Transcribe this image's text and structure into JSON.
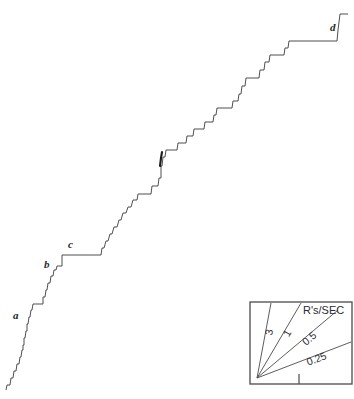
{
  "figure": {
    "width": 354,
    "height": 399,
    "background": "#ffffff",
    "ink_color": "#3b3b42"
  },
  "chart_data": {
    "type": "line",
    "title": "",
    "xlabel": "",
    "ylabel": "",
    "grid": false,
    "legend_position": "bottom-right",
    "xlim": [
      0,
      354
    ],
    "ylim": [
      399,
      0
    ],
    "series": [
      {
        "name": "cumulative-record",
        "points": [
          [
            6,
            390
          ],
          [
            7,
            385
          ],
          [
            10,
            385
          ],
          [
            11,
            378
          ],
          [
            13,
            378
          ],
          [
            14,
            371
          ],
          [
            16,
            371
          ],
          [
            17,
            364
          ],
          [
            19,
            364
          ],
          [
            20,
            357
          ],
          [
            21,
            357
          ],
          [
            22,
            350
          ],
          [
            23,
            350
          ],
          [
            23,
            345
          ],
          [
            24,
            345
          ],
          [
            24,
            338
          ],
          [
            25,
            338
          ],
          [
            26,
            331
          ],
          [
            27,
            331
          ],
          [
            27,
            324
          ],
          [
            28,
            324
          ],
          [
            29,
            317
          ],
          [
            30,
            317
          ],
          [
            31,
            310
          ],
          [
            32,
            310
          ],
          [
            33,
            304
          ],
          [
            43,
            304
          ],
          [
            43,
            297
          ],
          [
            45,
            297
          ],
          [
            46,
            290
          ],
          [
            47,
            290
          ],
          [
            48,
            283
          ],
          [
            50,
            283
          ],
          [
            51,
            276
          ],
          [
            53,
            276
          ],
          [
            54,
            270
          ],
          [
            56,
            270
          ],
          [
            57,
            266
          ],
          [
            62,
            266
          ],
          [
            62,
            255
          ],
          [
            101,
            255
          ],
          [
            102,
            248
          ],
          [
            104,
            248
          ],
          [
            106,
            241
          ],
          [
            108,
            241
          ],
          [
            110,
            234
          ],
          [
            112,
            234
          ],
          [
            114,
            227
          ],
          [
            117,
            227
          ],
          [
            119,
            220
          ],
          [
            121,
            220
          ],
          [
            123,
            213
          ],
          [
            126,
            213
          ],
          [
            128,
            207
          ],
          [
            131,
            207
          ],
          [
            133,
            200
          ],
          [
            137,
            200
          ],
          [
            138,
            194
          ],
          [
            151,
            194
          ],
          [
            152,
            186
          ],
          [
            158,
            186
          ],
          [
            159,
            178
          ],
          [
            161,
            178
          ],
          [
            161,
            166
          ],
          [
            162,
            166
          ],
          [
            163,
            157
          ],
          [
            165,
            157
          ],
          [
            166,
            150
          ],
          [
            177,
            150
          ],
          [
            178,
            143
          ],
          [
            186,
            143
          ],
          [
            187,
            136
          ],
          [
            193,
            136
          ],
          [
            194,
            129
          ],
          [
            204,
            129
          ],
          [
            205,
            122
          ],
          [
            213,
            122
          ],
          [
            214,
            115
          ],
          [
            216,
            115
          ],
          [
            217,
            108
          ],
          [
            232,
            108
          ],
          [
            233,
            101
          ],
          [
            238,
            101
          ],
          [
            239,
            94
          ],
          [
            241,
            94
          ],
          [
            242,
            86
          ],
          [
            245,
            86
          ],
          [
            246,
            78
          ],
          [
            259,
            78
          ],
          [
            260,
            70
          ],
          [
            264,
            70
          ],
          [
            265,
            62
          ],
          [
            269,
            62
          ],
          [
            270,
            55
          ],
          [
            284,
            55
          ],
          [
            285,
            48
          ],
          [
            288,
            48
          ],
          [
            289,
            41
          ],
          [
            337,
            41
          ],
          [
            338,
            30
          ],
          [
            339,
            22
          ],
          [
            340,
            14
          ],
          [
            348,
            14
          ]
        ],
        "blip": {
          "name": "pen-reset-mark",
          "points": [
            [
              160,
              166
            ],
            [
              161,
              158
            ],
            [
              162,
              152
            ]
          ]
        }
      }
    ],
    "annotations": [
      {
        "name": "point-a",
        "label": "a",
        "x": 13,
        "y": 319
      },
      {
        "name": "point-b",
        "label": "b",
        "x": 44,
        "y": 268
      },
      {
        "name": "point-c",
        "label": "c",
        "x": 68,
        "y": 248
      },
      {
        "name": "point-d",
        "label": "d",
        "x": 330,
        "y": 31
      }
    ],
    "legend": {
      "name": "rate-key",
      "title": "R's/SEC",
      "box": {
        "x": 250,
        "y": 302,
        "width": 102,
        "height": 82
      },
      "origin": {
        "x": 257,
        "y": 378
      },
      "rays": [
        {
          "label": "3",
          "value": 3,
          "end_x": 271,
          "end_y": 303
        },
        {
          "label": "1",
          "value": 1,
          "end_x": 301,
          "end_y": 303
        },
        {
          "label": "0.5",
          "value": 0.5,
          "end_x": 338,
          "end_y": 310
        },
        {
          "label": "0.25",
          "value": 0.25,
          "end_x": 351,
          "end_y": 342
        }
      ],
      "tick": {
        "x": 299,
        "y_top": 374,
        "y_bottom": 384
      },
      "title_x": 303,
      "title_y": 314
    }
  }
}
